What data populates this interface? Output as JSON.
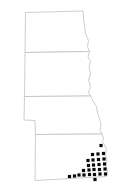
{
  "figure": {
    "name": "state-outline-map",
    "kind": "choropleth-point-map",
    "width": 124,
    "height": 193,
    "background_color": "#ffffff",
    "has_title": false,
    "has_legend": false,
    "has_axes": false,
    "has_labels": false
  },
  "style": {
    "outline_color": "#b9b9b9",
    "outline_width": 0.7,
    "marker_color": "#0a0a0a",
    "marker_shape": "square",
    "marker_size": 3.2,
    "state_fill": "#ffffff"
  },
  "states": [
    {
      "id": "state-north-dakota",
      "label": "North Dakota",
      "order": 1,
      "marker_count": 0,
      "path": "M 25.5 12.5 L 83.0 11.0 L 84.0 22.0 L 85.5 33.5 L 88.5 40.5 L 87.5 46.5 L 89.5 51.5 L 25.0 52.5 Z"
    },
    {
      "id": "state-south-dakota",
      "label": "South Dakota",
      "order": 2,
      "marker_count": 0,
      "path": "M 25.0 52.5 L 89.5 51.5 L 88.0 56.5 L 90.5 61.5 L 89.0 67.0 L 90.5 74.0 L 88.5 80.0 L 90.5 86.5 L 88.5 92.0 L 90.5 96.0 L 24.5 96.5 Z"
    },
    {
      "id": "state-nebraska",
      "label": "Nebraska",
      "order": 3,
      "marker_count": 0,
      "path": "M 24.5 96.5 L 90.5 96.0 L 93.0 101.0 L 96.5 106.5 L 97.5 112.5 L 99.5 118.5 L 101.0 124.5 L 100.0 130.5 L 102.0 134.0 L 35.5 134.5 L 35.0 120.5 L 24.0 120.0 Z"
    },
    {
      "id": "state-kansas",
      "label": "Kansas",
      "order": 4,
      "marker_count": 26,
      "path": "M 35.5 134.5 L 102.0 134.0 L 103.5 138.0 L 102.5 141.5 L 104.5 145.0 L 106.5 149.5 L 105.5 155.5 L 107.0 160.0 L 106.0 166.5 L 107.5 171.0 L 106.5 176.5 L 35.0 180.5 Z"
    }
  ],
  "markers": {
    "name": "data-point-markers",
    "count": 26,
    "region": "southeast-kansas",
    "points": [
      {
        "x": 101.0,
        "y": 145.5
      },
      {
        "x": 92.5,
        "y": 154.5
      },
      {
        "x": 98.0,
        "y": 154.0
      },
      {
        "x": 103.5,
        "y": 153.5
      },
      {
        "x": 88.0,
        "y": 160.5
      },
      {
        "x": 93.0,
        "y": 160.0
      },
      {
        "x": 98.5,
        "y": 159.5
      },
      {
        "x": 104.0,
        "y": 159.0
      },
      {
        "x": 88.5,
        "y": 165.5
      },
      {
        "x": 93.5,
        "y": 165.0
      },
      {
        "x": 99.0,
        "y": 164.5
      },
      {
        "x": 104.5,
        "y": 164.0
      },
      {
        "x": 83.5,
        "y": 170.5
      },
      {
        "x": 89.0,
        "y": 170.0
      },
      {
        "x": 94.0,
        "y": 169.5
      },
      {
        "x": 99.5,
        "y": 169.5
      },
      {
        "x": 105.0,
        "y": 169.0
      },
      {
        "x": 79.0,
        "y": 175.0
      },
      {
        "x": 84.0,
        "y": 175.0
      },
      {
        "x": 89.5,
        "y": 174.5
      },
      {
        "x": 94.5,
        "y": 174.5
      },
      {
        "x": 100.0,
        "y": 174.0
      },
      {
        "x": 105.5,
        "y": 174.0
      },
      {
        "x": 69.5,
        "y": 176.5
      },
      {
        "x": 74.5,
        "y": 176.0
      },
      {
        "x": 95.0,
        "y": 179.5
      }
    ]
  }
}
